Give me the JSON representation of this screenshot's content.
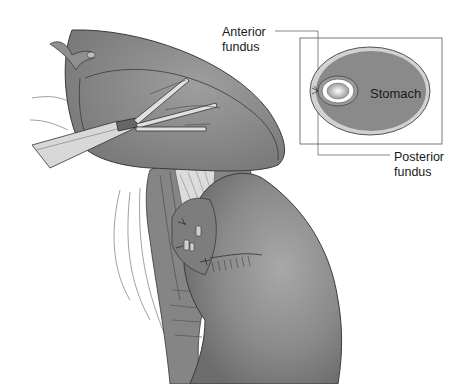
{
  "figure": {
    "labels": {
      "anterior_fundus": "Anterior\nfundus",
      "posterior_fundus": "Posterior\nfundus",
      "stomach": "Stomach"
    },
    "colors": {
      "organ_fill": "#8c8c8c",
      "organ_dark": "#6e6e6e",
      "organ_light": "#b4b4b4",
      "outline": "#3a3a3a",
      "inset_inner": "#e6e6e6",
      "background": "#ffffff"
    }
  }
}
